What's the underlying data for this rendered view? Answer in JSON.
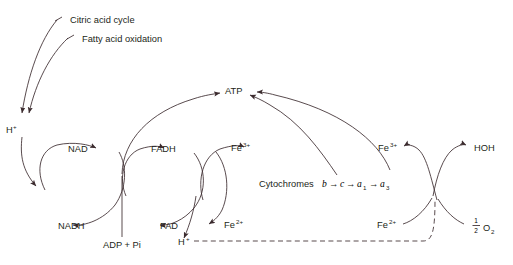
{
  "diagram": {
    "stroke_color": "#3b2b2e",
    "text_color": "#231f20",
    "background_color": "#ffffff",
    "inputs": {
      "citric_acid_cycle": "Citric acid cycle",
      "fatty_acid_oxidation": "Fatty acid oxidation"
    },
    "nodes": {
      "h_plus_left": {
        "base": "H",
        "sup": "+"
      },
      "nad": "NAD",
      "nadh": "NADH",
      "fadh": "FADH",
      "fad": "FAD",
      "fe3_mid": {
        "base": "Fe",
        "sup": "3+"
      },
      "fe2_mid": {
        "base": "Fe",
        "sup": "2+"
      },
      "fe3_right": {
        "base": "Fe",
        "sup": "3+"
      },
      "fe2_right": {
        "base": "Fe",
        "sup": "2+"
      },
      "h_plus_bottom": {
        "base": "H",
        "sup": "+"
      },
      "atp": "ATP",
      "hoh": "HOH",
      "adp_pi": "ADP + Pi",
      "half_o2": {
        "numerator": "1",
        "denominator": "2",
        "base": "O",
        "sub": "2"
      }
    },
    "cytochromes": {
      "prefix": "Cytochromes",
      "chain": [
        {
          "letter": "b",
          "sub": ""
        },
        {
          "letter": "c",
          "sub": ""
        },
        {
          "letter": "a",
          "sub": "1"
        },
        {
          "letter": "a",
          "sub": "3"
        }
      ],
      "arrow_glyph": "→"
    }
  }
}
